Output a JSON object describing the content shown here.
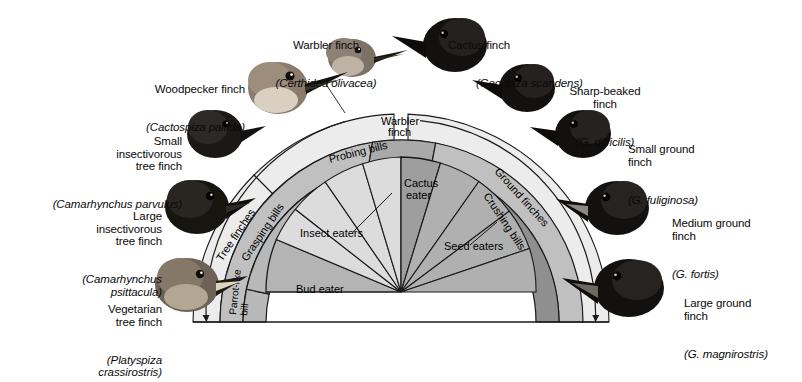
{
  "figure": {
    "type": "fan-diagram"
  },
  "species": [
    {
      "id": "warbler-finch",
      "common": "Warbler finch",
      "scientific": "(Certhidea olivacea)"
    },
    {
      "id": "woodpecker-finch",
      "common": "Woodpecker finch",
      "scientific": "(Cactospiza pallida)"
    },
    {
      "id": "small-insectivorous-tree-finch",
      "common": "Small\ninsectivorous\ntree finch",
      "scientific": "(Camarhynchus parvulus)"
    },
    {
      "id": "large-insectivorous-tree-finch",
      "common": "Large\ninsectivorous\ntree finch",
      "scientific": "(Camarhynchus\npsittacula)"
    },
    {
      "id": "vegetarian-tree-finch",
      "common": "Vegetarian\ntree finch",
      "scientific": "(Platyspiza\ncrassirostris)"
    },
    {
      "id": "cactus-finch",
      "common": "Cactus finch",
      "scientific": "(Geospiza scandens)"
    },
    {
      "id": "sharp-beaked-finch",
      "common": "Sharp-beaked\nfinch",
      "scientific": "(G. difficilis)"
    },
    {
      "id": "small-ground-finch",
      "common": "Small ground\nfinch",
      "scientific": "(G. fuliginosa)"
    },
    {
      "id": "medium-ground-finch",
      "common": "Medium ground\nfinch",
      "scientific": "(G. fortis)"
    },
    {
      "id": "large-ground-finch",
      "common": "Large ground\nfinch",
      "scientific": "(G. magnirostris)"
    }
  ],
  "fan": {
    "inner_sectors": [
      {
        "id": "bud-eater",
        "label": "Bud eater"
      },
      {
        "id": "insect-eaters",
        "label": "Insect eaters"
      },
      {
        "id": "cactus-eater",
        "label": "Cactus\neater"
      },
      {
        "id": "seed-eaters",
        "label": "Seed eaters"
      }
    ],
    "bill_bands": [
      {
        "id": "parrot-like-bill",
        "label": "Parrot-like\nbill"
      },
      {
        "id": "grasping-bills",
        "label": "Grasping bills"
      },
      {
        "id": "probing-bills",
        "label": "Probing bills"
      },
      {
        "id": "crushing-bills",
        "label": "Crushing bills"
      }
    ],
    "group_bands": [
      {
        "id": "tree-finches",
        "label": "Tree finches"
      },
      {
        "id": "warbler-finch-band",
        "label": "Warbler\nfinch"
      },
      {
        "id": "ground-finches",
        "label": "Ground finches"
      }
    ]
  },
  "colors": {
    "insect_sector": "#dcdcdc",
    "seed_sector": "#b0b0b0",
    "bud_sector": "#b4b4b4",
    "cactus_sector": "#9e9e9e",
    "bill_band_left": "#c4c4c4",
    "bill_band_right": "#8e8e8e",
    "group_band": "#bdbdbd",
    "arrow_band": "#e6e6e6",
    "stroke": "#1a1a1a"
  }
}
